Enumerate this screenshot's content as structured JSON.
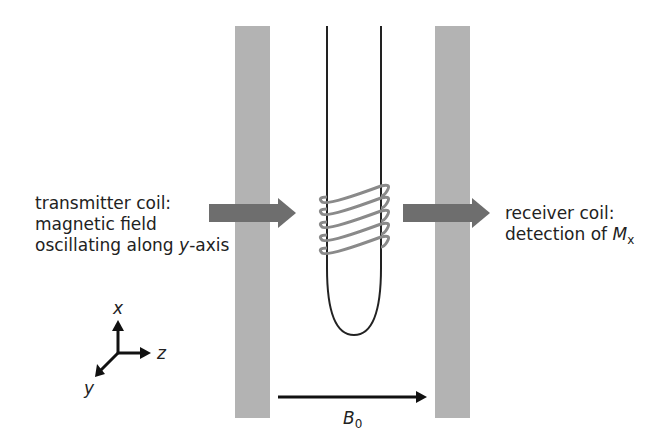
{
  "diagram": {
    "transmitter": {
      "line1": "transmitter coil:",
      "line2": "magnetic field",
      "line3_prefix": "oscillating along ",
      "line3_var": "y",
      "line3_suffix": "-axis"
    },
    "receiver": {
      "line1": "receiver coil:",
      "line2_prefix": "detection of ",
      "line2_var": "M",
      "line2_sub": "x"
    },
    "axes": {
      "x": "x",
      "y": "y",
      "z": "z"
    },
    "field": {
      "symbol": "B",
      "sub": "0"
    },
    "colors": {
      "bar": "#b3b3b3",
      "arrow": "#707070",
      "coil": "#8a8a8a",
      "line": "#222222"
    }
  }
}
